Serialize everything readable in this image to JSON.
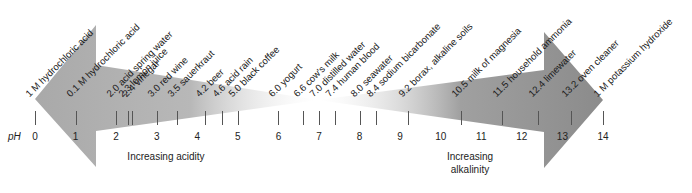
{
  "axis": {
    "label": "pH",
    "ticks": [
      "0",
      "1",
      "2",
      "3",
      "4",
      "5",
      "6",
      "7",
      "8",
      "9",
      "10",
      "11",
      "12",
      "13",
      "14"
    ]
  },
  "captions": {
    "acidity": "Increasing acidity",
    "alkalinity": "Increasing alkalinity"
  },
  "colors": {
    "acid_arrow": "#a9a9a9",
    "base_arrow": "#8b8b8b",
    "tick": "#555555"
  },
  "substances": [
    {
      "ph": 0.0,
      "label": "1 M hydrochloric acid"
    },
    {
      "ph": 1.0,
      "label": "0.1 M hydrochloric acid"
    },
    {
      "ph": 2.0,
      "label": "2.0 acid spring water"
    },
    {
      "ph": 2.3,
      "label": "2.3 lemon juice"
    },
    {
      "ph": 2.4,
      "label": "2.4 vinegar"
    },
    {
      "ph": 3.0,
      "label": "3.0 red wine"
    },
    {
      "ph": 3.5,
      "label": "3.5 sauerkraut"
    },
    {
      "ph": 4.2,
      "label": "4.2 beer"
    },
    {
      "ph": 4.6,
      "label": "4.6 acid rain"
    },
    {
      "ph": 5.0,
      "label": "5.0 black coffee"
    },
    {
      "ph": 6.0,
      "label": "6.0 yogurt"
    },
    {
      "ph": 6.6,
      "label": "6.6 cow's milk"
    },
    {
      "ph": 7.0,
      "label": "7.0 distilled water"
    },
    {
      "ph": 7.4,
      "label": "7.4 human blood"
    },
    {
      "ph": 8.0,
      "label": "8.0 seawater"
    },
    {
      "ph": 8.4,
      "label": "8.4 sodium bicarbonate"
    },
    {
      "ph": 9.2,
      "label": "9.2 borax, alkaline soils"
    },
    {
      "ph": 10.5,
      "label": "10.5 milk of magnesia"
    },
    {
      "ph": 11.5,
      "label": "11.5 household ammonia"
    },
    {
      "ph": 12.4,
      "label": "12.4 limewater"
    },
    {
      "ph": 13.2,
      "label": "13.2 oven cleaner"
    },
    {
      "ph": 14.0,
      "label": "1 M potassium hydroxide"
    }
  ]
}
